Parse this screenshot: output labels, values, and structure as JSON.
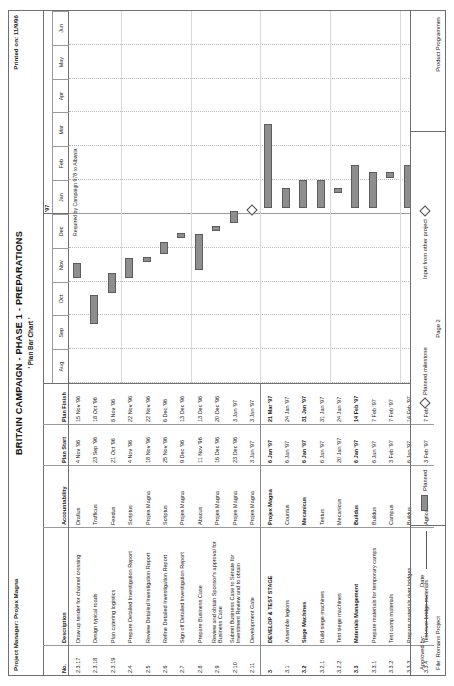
{
  "header": {
    "project_manager": "Project Manager: Projex Magna",
    "printed_on": "Printed on: 11/9/96",
    "title": "BRITAIN CAMPAIGN - PHASE 1 - PREPARATIONS",
    "subtitle": "' Plan Bar Chart '"
  },
  "table": {
    "columns": [
      "No.",
      "Description",
      "Accountability",
      "Plan Start",
      "Plan Finish"
    ],
    "rows": [
      {
        "no": "2.3.17",
        "desc": "Draw up tender for channel crossing",
        "acc": "Drafius",
        "start": "4 Nov '96",
        "finish": "15 Nov '96",
        "bold": false,
        "section": false
      },
      {
        "no": "2.3.18",
        "desc": "Design typical roads",
        "acc": "Trafficus",
        "start": "23 Sep '96",
        "finish": "18 Oct '96",
        "bold": false,
        "section": false
      },
      {
        "no": "2.3.19",
        "desc": "Plan catering logistics",
        "acc": "Feedus",
        "start": "21 Oct '96",
        "finish": "8 Nov '96",
        "bold": false,
        "section": false
      },
      {
        "no": "2.4",
        "desc": "Prepare Detailed Investigation Report",
        "acc": "Scriptus",
        "start": "4 Nov '96",
        "finish": "22 Nov '96",
        "bold": false,
        "section": false
      },
      {
        "no": "2.5",
        "desc": "Review Detailed Investigation Report",
        "acc": "Projex Magna",
        "start": "18 Nov '96",
        "finish": "22 Nov '96",
        "bold": false,
        "section": false
      },
      {
        "no": "2.6",
        "desc": "Refine Detailed Investigation Report",
        "acc": "Scriptus",
        "start": "25 Nov '96",
        "finish": "6 Dec '96",
        "bold": false,
        "section": false
      },
      {
        "no": "2.7",
        "desc": "Sign off Detailed Investigation Report",
        "acc": "Projex Magna",
        "start": "9 Dec '96",
        "finish": "13 Dec '96",
        "bold": false,
        "section": false
      },
      {
        "no": "2.8",
        "desc": "Prepare Business Case",
        "acc": "Abacus",
        "start": "11 Nov '96",
        "finish": "13 Dec '96",
        "bold": false,
        "section": false
      },
      {
        "no": "2.9",
        "desc": "Review and obtain Sponsor's approval for Business Case",
        "acc": "Projex Magna",
        "start": "16 Dec '96",
        "finish": "20 Dec '96",
        "bold": false,
        "section": false
      },
      {
        "no": "2.10",
        "desc": "Submit Business Case to Senate for Investment Review and to obtain",
        "acc": "Projex Magna",
        "start": "23 Dec '96",
        "finish": "3 Jan '97",
        "bold": false,
        "section": false
      },
      {
        "no": "2.11",
        "desc": "Development Gate",
        "acc": "Projex Magna",
        "start": "3 Jan '97",
        "finish": "3 Jan '97",
        "bold": false,
        "section": false
      },
      {
        "no": "3",
        "desc": "DEVELOP & TEST STAGE",
        "acc": "Projex Magna",
        "start": "6 Jan '97",
        "finish": "21 Mar '97",
        "bold": true,
        "section": true
      },
      {
        "no": "3.1",
        "desc": "Assemble legions",
        "acc": "Countus",
        "start": "6 Jan '97",
        "finish": "24 Jan '97",
        "bold": false,
        "section": false
      },
      {
        "no": "3.2",
        "desc": "Siege Machines",
        "acc": "Mecanicus",
        "start": "6 Jan '97",
        "finish": "31 Jan '97",
        "bold": true,
        "section": false
      },
      {
        "no": "3.2.1",
        "desc": "Build siege machines",
        "acc": "Testus",
        "start": "6 Jan '97",
        "finish": "31 Jan '97",
        "bold": false,
        "section": false
      },
      {
        "no": "3.2.2",
        "desc": "Test siege machines",
        "acc": "Mecanicus",
        "start": "20 Jan '97",
        "finish": "24 Jan '97",
        "bold": false,
        "section": false
      },
      {
        "no": "3.3",
        "desc": "Materials Management",
        "acc": "Buildus",
        "start": "6 Jan '97",
        "finish": "14 Feb '97",
        "bold": true,
        "section": false
      },
      {
        "no": "3.3.1",
        "desc": "Prepare materials for temporary camps",
        "acc": "Buildus",
        "start": "6 Jan '97",
        "finish": "7 Feb '97",
        "bold": false,
        "section": false
      },
      {
        "no": "3.3.2",
        "desc": "Test camp materials",
        "acc": "Campus",
        "start": "3 Feb '97",
        "finish": "7 Feb '97",
        "bold": false,
        "section": false
      },
      {
        "no": "3.3.3",
        "desc": "Prepare materials river bridges",
        "acc": "Buildus",
        "start": "6 Jan '97",
        "finish": "14 Feb '97",
        "bold": false,
        "section": false
      },
      {
        "no": "3.3.4",
        "desc": "Test river bridge materials",
        "acc": "Agricola",
        "start": "3 Feb '97",
        "finish": "7 Feb '97",
        "bold": false,
        "section": false
      }
    ]
  },
  "gantt": {
    "year_label": "'97",
    "months": [
      "Aug",
      "Sep",
      "Oct",
      "Nov",
      "Dec",
      "Jan",
      "Feb",
      "Mar",
      "Apr",
      "May",
      "Jun"
    ],
    "annotation": "Required by Campaign 978 to Albania",
    "bars": [
      {
        "row": 0,
        "start_month": 3.1,
        "end_month": 3.55,
        "type": "bar"
      },
      {
        "row": 1,
        "start_month": 1.75,
        "end_month": 2.6,
        "type": "bar"
      },
      {
        "row": 2,
        "start_month": 2.65,
        "end_month": 3.25,
        "type": "bar"
      },
      {
        "row": 3,
        "start_month": 3.1,
        "end_month": 3.7,
        "type": "bar"
      },
      {
        "row": 4,
        "start_month": 3.58,
        "end_month": 3.72,
        "type": "bar"
      },
      {
        "row": 5,
        "start_month": 3.8,
        "end_month": 4.18,
        "type": "bar"
      },
      {
        "row": 6,
        "start_month": 4.28,
        "end_month": 4.42,
        "type": "bar"
      },
      {
        "row": 7,
        "start_month": 3.35,
        "end_month": 4.42,
        "type": "bar"
      },
      {
        "row": 8,
        "start_month": 4.5,
        "end_month": 4.65,
        "type": "bar"
      },
      {
        "row": 9,
        "start_month": 4.73,
        "end_month": 5.08,
        "type": "bar"
      },
      {
        "row": 10,
        "start_month": 5.08,
        "end_month": 5.08,
        "type": "milestone"
      },
      {
        "row": 11,
        "start_month": 5.17,
        "end_month": 7.65,
        "type": "bar"
      },
      {
        "row": 12,
        "start_month": 5.17,
        "end_month": 5.78,
        "type": "bar"
      },
      {
        "row": 13,
        "start_month": 5.17,
        "end_month": 6.0,
        "type": "bar"
      },
      {
        "row": 14,
        "start_month": 5.17,
        "end_month": 6.0,
        "type": "bar"
      },
      {
        "row": 15,
        "start_month": 5.63,
        "end_month": 5.78,
        "type": "bar"
      },
      {
        "row": 16,
        "start_month": 5.17,
        "end_month": 6.45,
        "type": "bar"
      },
      {
        "row": 17,
        "start_month": 5.17,
        "end_month": 6.23,
        "type": "bar"
      },
      {
        "row": 18,
        "start_month": 6.07,
        "end_month": 6.23,
        "type": "bar"
      },
      {
        "row": 19,
        "start_month": 5.17,
        "end_month": 6.45,
        "type": "bar"
      },
      {
        "row": 20,
        "start_month": 6.07,
        "end_month": 6.23,
        "type": "bar"
      }
    ]
  },
  "footer": {
    "approved_by": "Approved by:",
    "date": "Date",
    "file": "File: Romans Project",
    "legend_planned": "Planned",
    "legend_milestone": "Planned milestone",
    "legend_input": "Input from other project",
    "page": "Page 2",
    "product": "Product Programmes"
  }
}
